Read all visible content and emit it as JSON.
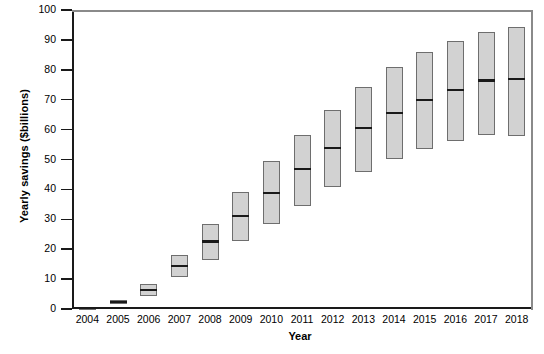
{
  "chart_data": {
    "type": "box",
    "title": "",
    "xlabel": "Year",
    "ylabel": "Yearly savings ($billions)",
    "ylim": [
      0,
      100
    ],
    "ytick_labels": [
      "100",
      "90",
      "80",
      "70",
      "60",
      "50",
      "40",
      "30",
      "20",
      "10",
      "0"
    ],
    "ytick_values": [
      100,
      90,
      80,
      70,
      60,
      50,
      40,
      30,
      20,
      10,
      0
    ],
    "categories": [
      "2004",
      "2005",
      "2006",
      "2007",
      "2008",
      "2009",
      "2010",
      "2011",
      "2012",
      "2013",
      "2014",
      "2015",
      "2016",
      "2017",
      "2018"
    ],
    "grid": false,
    "legend": "none",
    "box_fill_color": "#d2d2d2",
    "box_edge_color": "#6e6e6e",
    "median_color": "#1a1a1a",
    "boxes": [
      {
        "year": "2004",
        "q1": 0.0,
        "median": 0.3,
        "q3": 0.6
      },
      {
        "year": "2005",
        "q1": 1.6,
        "median": 2.3,
        "q3": 3.1
      },
      {
        "year": "2006",
        "q1": 4.3,
        "median": 6.3,
        "q3": 8.4
      },
      {
        "year": "2007",
        "q1": 10.6,
        "median": 14.3,
        "q3": 18.0
      },
      {
        "year": "2008",
        "q1": 16.4,
        "median": 22.6,
        "q3": 28.3
      },
      {
        "year": "2009",
        "q1": 22.7,
        "median": 31.1,
        "q3": 39.2
      },
      {
        "year": "2010",
        "q1": 28.5,
        "median": 38.7,
        "q3": 49.4
      },
      {
        "year": "2011",
        "q1": 34.5,
        "median": 46.8,
        "q3": 58.1
      },
      {
        "year": "2012",
        "q1": 40.8,
        "median": 53.9,
        "q3": 66.4
      },
      {
        "year": "2013",
        "q1": 45.8,
        "median": 60.6,
        "q3": 74.1
      },
      {
        "year": "2014",
        "q1": 50.3,
        "median": 65.6,
        "q3": 80.8
      },
      {
        "year": "2015",
        "q1": 53.6,
        "median": 69.9,
        "q3": 85.9
      },
      {
        "year": "2016",
        "q1": 56.1,
        "median": 73.3,
        "q3": 89.5
      },
      {
        "year": "2017",
        "q1": 58.1,
        "median": 76.4,
        "q3": 92.6
      },
      {
        "year": "2018",
        "q1": 57.8,
        "median": 76.8,
        "q3": 94.4
      }
    ]
  }
}
